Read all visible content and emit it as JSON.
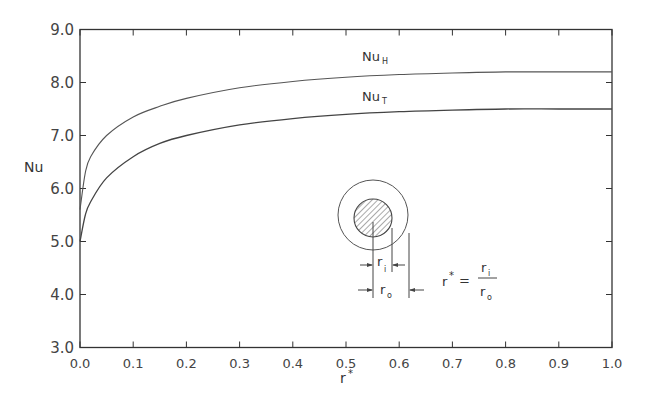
{
  "chart_data": {
    "type": "line",
    "title": "",
    "xlabel": "r*",
    "ylabel": "Nu",
    "xlim": [
      0.0,
      1.0
    ],
    "ylim": [
      3.0,
      9.0
    ],
    "grid": false,
    "legend": "inline labels above curves",
    "x_ticks": [
      "0.0",
      "0.1",
      "0.2",
      "0.3",
      "0.4",
      "0.5",
      "0.6",
      "0.7",
      "0.8",
      "0.9",
      "1.0"
    ],
    "y_ticks": [
      "3.0",
      "4.0",
      "5.0",
      "6.0",
      "7.0",
      "8.0",
      "9.0"
    ],
    "x": [
      0.0,
      0.01,
      0.02,
      0.05,
      0.1,
      0.15,
      0.2,
      0.3,
      0.4,
      0.5,
      0.6,
      0.7,
      0.8,
      0.9,
      1.0
    ],
    "series": [
      {
        "name": "Nu_H",
        "label_main": "Nu",
        "label_sub": "H",
        "values": [
          5.6,
          6.3,
          6.6,
          7.0,
          7.35,
          7.55,
          7.7,
          7.9,
          8.02,
          8.1,
          8.15,
          8.18,
          8.2,
          8.2,
          8.2
        ]
      },
      {
        "name": "Nu_T",
        "label_main": "Nu",
        "label_sub": "T",
        "values": [
          5.0,
          5.5,
          5.75,
          6.2,
          6.6,
          6.85,
          7.0,
          7.2,
          7.32,
          7.4,
          7.45,
          7.48,
          7.5,
          7.5,
          7.5
        ]
      }
    ],
    "annotations": {
      "inset": "concentric annulus cross-section with hatched inner core",
      "ri_label_main": "r",
      "ri_label_sub": "i",
      "ro_label_main": "r",
      "ro_label_sub": "o",
      "definition_lhs": "r",
      "definition_star": "*",
      "definition_eq": "=",
      "definition_num_main": "r",
      "definition_num_sub": "i",
      "definition_den_main": "r",
      "definition_den_sub": "o"
    },
    "colors": {
      "line": "#444444",
      "axis": "#333333",
      "hatch": "#555555"
    }
  }
}
